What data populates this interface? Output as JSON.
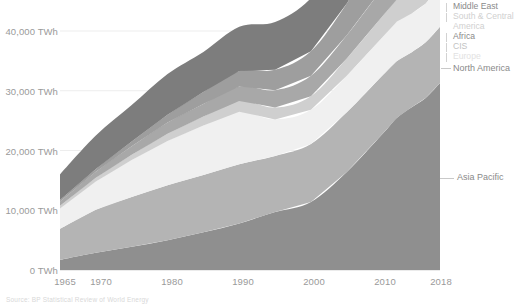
{
  "chart_data": {
    "type": "area",
    "title": "",
    "subtitle": "",
    "xlabel": "",
    "ylabel": "",
    "stacked": true,
    "grid": true,
    "legend_position": "right",
    "xlim": [
      1965,
      2018
    ],
    "ylim": [
      0,
      44000
    ],
    "y_ticks": [
      0,
      10000,
      20000,
      30000,
      40000
    ],
    "y_tick_labels": [
      "0 TWh",
      "10,000 TWh",
      "20,000 TWh",
      "30,000 TWh",
      "40,000 TWh"
    ],
    "x_ticks": [
      1965,
      1970,
      1980,
      1990,
      2000,
      2010,
      2018
    ],
    "x_tick_labels": [
      "1965",
      "1970",
      "1980",
      "1990",
      "2000",
      "2010",
      "2018"
    ],
    "x": [
      1965,
      1970,
      1975,
      1980,
      1985,
      1990,
      1995,
      2000,
      2005,
      2010,
      2012,
      2014,
      2016,
      2018
    ],
    "series": [
      {
        "name": "Asia Pacific",
        "color": "#8f8f8f",
        "values": [
          1700,
          2900,
          3900,
          5000,
          6300,
          7800,
          9700,
          11400,
          16400,
          22800,
          25500,
          27200,
          28800,
          31300
        ]
      },
      {
        "name": "Europe",
        "color": "#b4b4b4",
        "values": [
          5200,
          7200,
          8300,
          9200,
          9600,
          9900,
          9400,
          9700,
          10000,
          9800,
          9500,
          9200,
          9300,
          9400
        ]
      },
      {
        "name": "CIS",
        "color": "#f0f0f0",
        "values": [
          3400,
          4700,
          6200,
          7400,
          8300,
          8800,
          6100,
          5700,
          6100,
          6400,
          6600,
          6500,
          6500,
          6800
        ]
      },
      {
        "name": "Africa",
        "color": "#cfcfcf",
        "values": [
          450,
          650,
          900,
          1200,
          1500,
          1800,
          2000,
          2300,
          2900,
          3500,
          3700,
          3900,
          4000,
          4200
        ]
      },
      {
        "name": "South & Central America",
        "color": "#a8a8a8",
        "values": [
          700,
          1000,
          1400,
          1900,
          2100,
          2400,
          2900,
          3400,
          3900,
          4700,
          5000,
          5200,
          5200,
          5300
        ]
      },
      {
        "name": "Middle East",
        "color": "#9e9e9e",
        "values": [
          250,
          450,
          800,
          1300,
          2000,
          2600,
          3400,
          4100,
          5300,
          7000,
          7600,
          8000,
          8300,
          8600
        ]
      },
      {
        "name": "North America",
        "color": "#7d7d7d",
        "values": [
          4300,
          5600,
          6100,
          6800,
          6700,
          7400,
          8000,
          8900,
          9200,
          9000,
          8800,
          9000,
          8900,
          9100
        ]
      }
    ],
    "totals": [
      16000,
      22500,
      27600,
      32800,
      36500,
      40700,
      41500,
      45500,
      53800,
      63200,
      66700,
      69000,
      71000,
      74700
    ]
  },
  "axis": {
    "y_labels": [
      {
        "text": "40,000 TWh",
        "value": 40000
      },
      {
        "text": "30,000 TWh",
        "value": 30000
      },
      {
        "text": "20,000 TWh",
        "value": 20000
      },
      {
        "text": "10,000 TWh",
        "value": 10000
      },
      {
        "text": "0 TWh",
        "value": 0
      }
    ],
    "x_labels": [
      {
        "text": "1965",
        "value": 1965
      },
      {
        "text": "1970",
        "value": 1970
      },
      {
        "text": "1980",
        "value": 1980
      },
      {
        "text": "1990",
        "value": 1990
      },
      {
        "text": "2000",
        "value": 2000
      },
      {
        "text": "2010",
        "value": 2010
      },
      {
        "text": "2018",
        "value": 2018
      }
    ]
  },
  "legend": {
    "top_items": [
      {
        "label": "Middle East",
        "tone": "dark"
      },
      {
        "label": "South & Central",
        "tone": "light"
      },
      {
        "label": "America",
        "tone": "light"
      },
      {
        "label": "Africa",
        "tone": "dark"
      },
      {
        "label": "CIS",
        "tone": "mid"
      },
      {
        "label": "Europe",
        "tone": "faint"
      },
      {
        "label": "North America",
        "tone": "dark"
      }
    ],
    "inline_items": [
      {
        "label": "Asia Pacific",
        "tone": "dark"
      }
    ]
  },
  "footer": {
    "text": "Source: BP Statistical Review of World Energy"
  }
}
